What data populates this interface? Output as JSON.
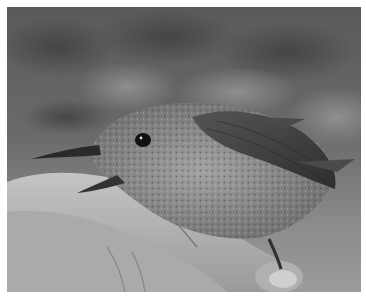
{
  "image": {
    "subject": "small bird held in a human hand",
    "style": "grayscale photograph",
    "colors": {
      "border": "#ffffff",
      "background_dark": "#4a4a4a",
      "background_light": "#9a9a9a",
      "bird_body": "#8a8a8a",
      "bird_wing": "#3c3c3c",
      "hand": "#b8b8b8"
    }
  }
}
